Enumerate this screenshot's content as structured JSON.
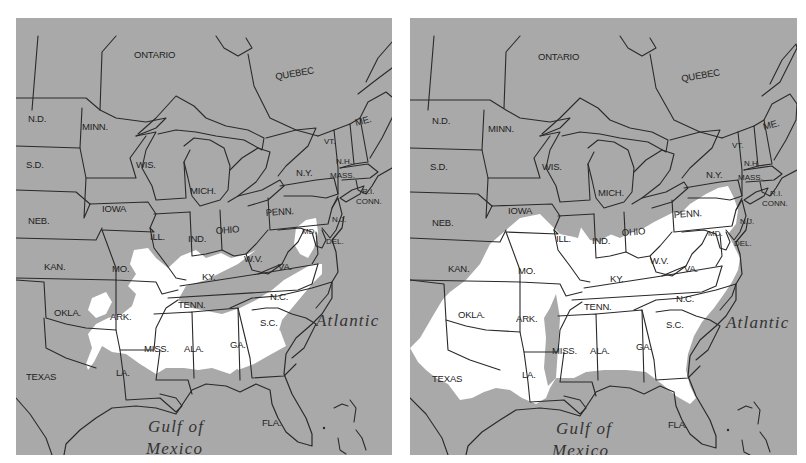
{
  "figure": {
    "background_color": "#a9a9a9",
    "range_color": "#ffffff",
    "line_color": "#2a2a2a"
  },
  "labels": {
    "ontario": "ONTARIO",
    "quebec": "QUEBEC",
    "nd": "N.D.",
    "minn": "MINN.",
    "sd": "S.D.",
    "wis": "WIS.",
    "mich": "MICH.",
    "ny": "N.Y.",
    "vt": "VT.",
    "nh": "N.H.",
    "me": "ME.",
    "mass": "MASS.",
    "ri": "R.I.",
    "conn": "CONN.",
    "iowa": "IOWA",
    "neb": "NEB.",
    "penn": "PENN.",
    "nj": "N.J.",
    "md": "MD.",
    "del": "DEL.",
    "ill": "ILL.",
    "ind": "IND.",
    "ohio": "OHIO",
    "wv": "W.V.",
    "va": "VA.",
    "kan": "KAN.",
    "mo": "MO.",
    "ky": "KY.",
    "nc": "N.C.",
    "tenn": "TENN.",
    "okla": "OKLA.",
    "ark": "ARK.",
    "sc": "S.C.",
    "miss": "MISS.",
    "ala": "ALA.",
    "ga": "GA.",
    "texas": "TEXAS",
    "la": "LA.",
    "fla": "FLA.",
    "atlantic": "Atlantic",
    "gulf_line1": "Gulf of",
    "gulf_line2": "Mexico"
  },
  "maps": [
    {
      "id": "left",
      "range_states_mostly_white": [
        "TENN.",
        "MISS.",
        "ALA.",
        "GA.",
        "S.C.",
        "N.C.",
        "LA.",
        "KY. (south)",
        "ARK. (east)",
        "FLA. (panhandle)",
        "N.J.",
        "DEL.",
        "MD."
      ]
    },
    {
      "id": "right",
      "range_states_mostly_white": [
        "TEXAS",
        "OKLA.",
        "MO.",
        "ARK.",
        "LA.",
        "TENN.",
        "KY.",
        "W.V.",
        "VA.",
        "N.C.",
        "S.C.",
        "GA.",
        "ALA.",
        "MISS.",
        "FLA. (north)",
        "OHIO (south)",
        "ILL. (south)",
        "IND. (south)",
        "PENN. (southeast)",
        "N.J.",
        "DEL.",
        "MD.",
        "KAN. (southeast)"
      ]
    }
  ]
}
